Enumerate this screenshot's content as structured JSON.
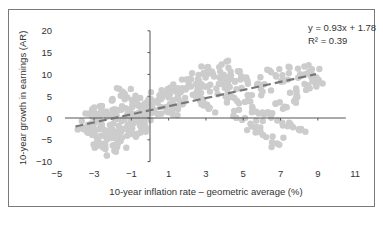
{
  "chart_data": {
    "type": "scatter",
    "title": "",
    "xlabel": "10-year inflation rate – geometric average (%)",
    "ylabel": "10-year growth in earnings (AR)",
    "xlim": [
      -5,
      11
    ],
    "ylim": [
      -10,
      20
    ],
    "x_ticks": [
      -5,
      -3,
      -1,
      1,
      3,
      5,
      7,
      9,
      11
    ],
    "y_ticks": [
      20,
      15,
      10,
      5,
      0,
      -5,
      -10
    ],
    "x_tick_labels": [
      "−5",
      "−3",
      "−1",
      "1",
      "3",
      "5",
      "7",
      "9",
      "11"
    ],
    "y_tick_labels": [
      "20",
      "15",
      "10",
      "5",
      "0",
      "−5",
      "−10"
    ],
    "grid": false,
    "legend": null,
    "annotations": [
      "y = 0.93x + 1.78",
      "R² = 0.39"
    ],
    "trendline": {
      "slope": 0.93,
      "intercept": 1.78,
      "x_start": -4.0,
      "x_end": 8.9,
      "style": "dashed",
      "color": "#777777"
    },
    "point_color": "#cccccc",
    "series": [
      {
        "name": "observations",
        "points": [
          [
            -3.5,
            -1.5
          ],
          [
            -3.3,
            -2.5
          ],
          [
            -3.2,
            0.5
          ],
          [
            -3.0,
            -4.0
          ],
          [
            -3.0,
            1.5
          ],
          [
            -2.9,
            -6.0
          ],
          [
            -2.8,
            -3.0
          ],
          [
            -2.7,
            0.0
          ],
          [
            -2.6,
            -7.5
          ],
          [
            -2.5,
            -5.0
          ],
          [
            -2.4,
            2.0
          ],
          [
            -2.3,
            -1.0
          ],
          [
            -2.2,
            -6.5
          ],
          [
            -2.1,
            -3.5
          ],
          [
            -2.0,
            1.0
          ],
          [
            -1.9,
            -4.5
          ],
          [
            -1.8,
            -2.0
          ],
          [
            -1.7,
            3.0
          ],
          [
            -1.6,
            0.5
          ],
          [
            -1.5,
            -5.5
          ],
          [
            -1.4,
            5.5
          ],
          [
            -1.3,
            -1.5
          ],
          [
            -1.2,
            2.0
          ],
          [
            -1.1,
            -3.0
          ],
          [
            -1.0,
            4.0
          ],
          [
            -0.9,
            0.0
          ],
          [
            -0.8,
            -2.5
          ],
          [
            -0.7,
            1.5
          ],
          [
            -0.6,
            3.5
          ],
          [
            -0.5,
            -1.0
          ],
          [
            -0.4,
            2.5
          ],
          [
            -0.3,
            0.5
          ],
          [
            -0.2,
            -3.0
          ],
          [
            -0.1,
            4.0
          ],
          [
            0.0,
            1.0
          ],
          [
            0.2,
            3.0
          ],
          [
            0.4,
            5.0
          ],
          [
            0.6,
            2.0
          ],
          [
            0.8,
            6.0
          ],
          [
            1.0,
            4.0
          ],
          [
            1.2,
            1.5
          ],
          [
            1.4,
            7.0
          ],
          [
            1.6,
            5.0
          ],
          [
            1.8,
            3.0
          ],
          [
            2.0,
            8.0
          ],
          [
            2.2,
            6.0
          ],
          [
            2.4,
            9.0
          ],
          [
            2.6,
            4.5
          ],
          [
            2.8,
            10.5
          ],
          [
            3.0,
            7.0
          ],
          [
            3.2,
            2.5
          ],
          [
            3.4,
            11.0
          ],
          [
            3.6,
            8.5
          ],
          [
            3.8,
            5.5
          ],
          [
            4.0,
            12.0
          ],
          [
            4.2,
            9.5
          ],
          [
            4.4,
            3.5
          ],
          [
            4.6,
            7.5
          ],
          [
            4.8,
            0.5
          ],
          [
            5.0,
            10.0
          ],
          [
            5.2,
            5.0
          ],
          [
            5.4,
            -1.5
          ],
          [
            5.6,
            8.0
          ],
          [
            5.8,
            2.0
          ],
          [
            6.0,
            -3.5
          ],
          [
            6.2,
            6.5
          ],
          [
            6.4,
            0.5
          ],
          [
            6.6,
            10.0
          ],
          [
            6.8,
            -5.5
          ],
          [
            7.0,
            3.0
          ],
          [
            7.2,
            -1.0
          ],
          [
            7.4,
            8.5
          ],
          [
            7.6,
            4.5
          ],
          [
            7.8,
            10.5
          ],
          [
            8.0,
            -2.5
          ],
          [
            8.2,
            6.0
          ],
          [
            8.4,
            11.0
          ],
          [
            8.6,
            8.0
          ],
          [
            8.8,
            10.0
          ],
          [
            9.0,
            7.5
          ]
        ]
      }
    ]
  }
}
